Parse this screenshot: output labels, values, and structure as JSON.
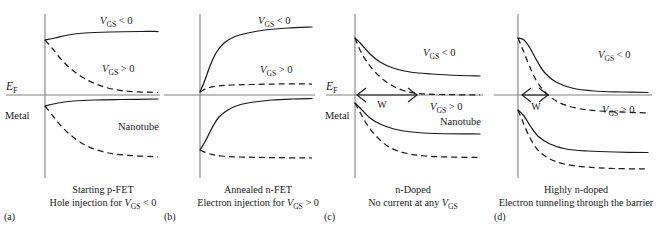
{
  "figure": {
    "width": 665,
    "height": 226,
    "background": "#ffffff",
    "ink_color": "#1a1a1a",
    "axis_color": "#808080"
  },
  "chart_data": {
    "type": "line",
    "xlabel": "",
    "ylabel": "Energy",
    "grid": false,
    "legend": "inline-annotations",
    "axis_note": "Vertical line = metal/nanotube interface; horizontal line = Fermi level E_F",
    "panels": [
      {
        "letter": "(a)",
        "caption_line1": "Starting p-FET",
        "caption_line2_prefix": "Hole injection for ",
        "caption_line2_var": "V",
        "caption_line2_sub": "GS",
        "caption_line2_suffix": " < 0",
        "ef_label_var": "E",
        "ef_label_sub": "F",
        "region_left": "Metal",
        "region_right": "Nanotube",
        "show_ef_label": true,
        "show_metal_label": true,
        "show_nanotube_label": true,
        "nanotube_label_x": 118,
        "nanotube_label_y": 130,
        "show_w_arrow": false,
        "w_label": "",
        "curves": [
          {
            "name": "conduction-band-vgs-negative",
            "style": "solid",
            "label": "VGS<0",
            "label_x": 100,
            "label_y": 24,
            "points": [
              [
                45,
                40
              ],
              [
                55,
                38
              ],
              [
                68,
                35
              ],
              [
                85,
                33
              ],
              [
                110,
                32
              ],
              [
                140,
                31.5
              ],
              [
                158,
                31.5
              ]
            ]
          },
          {
            "name": "conduction-band-vgs-positive",
            "style": "dashed",
            "label": "VGS>0",
            "label_x": 102,
            "label_y": 72,
            "points": [
              [
                45,
                40
              ],
              [
                52,
                48
              ],
              [
                60,
                58
              ],
              [
                70,
                68
              ],
              [
                82,
                77
              ],
              [
                96,
                84
              ],
              [
                112,
                89
              ],
              [
                130,
                91.5
              ],
              [
                158,
                92.5
              ]
            ]
          },
          {
            "name": "valence-band-vgs-negative",
            "style": "solid",
            "label": "",
            "label_x": 0,
            "label_y": 0,
            "points": [
              [
                45,
                106
              ],
              [
                58,
                103
              ],
              [
                74,
                101
              ],
              [
                95,
                100
              ],
              [
                120,
                99.5
              ],
              [
                158,
                99
              ]
            ]
          },
          {
            "name": "valence-band-vgs-positive",
            "style": "dashed",
            "label": "",
            "label_x": 0,
            "label_y": 0,
            "points": [
              [
                45,
                106
              ],
              [
                53,
                116
              ],
              [
                62,
                127
              ],
              [
                73,
                137
              ],
              [
                87,
                146
              ],
              [
                104,
                152
              ],
              [
                124,
                155
              ],
              [
                158,
                157
              ]
            ]
          }
        ]
      },
      {
        "letter": "(b)",
        "caption_line1": "Annealed n-FET",
        "caption_line2_prefix": "Electron injection for ",
        "caption_line2_var": "V",
        "caption_line2_sub": "GS",
        "caption_line2_suffix": " > 0",
        "ef_label_var": "",
        "ef_label_sub": "",
        "region_left": "",
        "region_right": "",
        "show_ef_label": false,
        "show_metal_label": false,
        "show_nanotube_label": false,
        "nanotube_label_x": 0,
        "nanotube_label_y": 0,
        "show_w_arrow": false,
        "w_label": "",
        "curves": [
          {
            "name": "conduction-band-vgs-negative",
            "style": "solid",
            "label": "VGS<0",
            "label_x": 98,
            "label_y": 24,
            "points": [
              [
                40,
                92
              ],
              [
                45,
                80
              ],
              [
                50,
                66
              ],
              [
                56,
                53
              ],
              [
                64,
                43
              ],
              [
                74,
                37
              ],
              [
                88,
                33
              ],
              [
                105,
                30
              ],
              [
                128,
                28
              ],
              [
                152,
                27
              ]
            ]
          },
          {
            "name": "conduction-band-vgs-positive",
            "style": "dashed",
            "label": "VGS>0",
            "label_x": 100,
            "label_y": 73,
            "points": [
              [
                40,
                92
              ],
              [
                48,
                88
              ],
              [
                58,
                86
              ],
              [
                72,
                85
              ],
              [
                92,
                84.5
              ],
              [
                118,
                84
              ],
              [
                152,
                84
              ]
            ]
          },
          {
            "name": "valence-band-vgs-negative",
            "style": "solid",
            "label": "",
            "label_x": 0,
            "label_y": 0,
            "points": [
              [
                40,
                150
              ],
              [
                46,
                140
              ],
              [
                52,
                128
              ],
              [
                59,
                117
              ],
              [
                68,
                110
              ],
              [
                79,
                105
              ],
              [
                94,
                102
              ],
              [
                112,
                100
              ],
              [
                132,
                99
              ],
              [
                152,
                98.5
              ]
            ]
          },
          {
            "name": "valence-band-vgs-positive",
            "style": "dashed",
            "label": "",
            "label_x": 0,
            "label_y": 0,
            "points": [
              [
                40,
                150
              ],
              [
                50,
                154
              ],
              [
                62,
                156
              ],
              [
                80,
                157
              ],
              [
                105,
                157.5
              ],
              [
                152,
                158
              ]
            ]
          }
        ]
      },
      {
        "letter": "(c)",
        "caption_line1": "n-Doped",
        "caption_line2_prefix": "No current at any ",
        "caption_line2_var": "V",
        "caption_line2_sub": "GS",
        "caption_line2_suffix": "",
        "ef_label_var": "E",
        "ef_label_sub": "F",
        "region_left": "Metal",
        "region_right": "Nanotube",
        "show_ef_label": true,
        "show_metal_label": true,
        "show_nanotube_label": true,
        "nanotube_label_x": 120,
        "nanotube_label_y": 125,
        "show_w_arrow": true,
        "w_label": "W",
        "w_arrow_x1": 37,
        "w_arrow_x2": 97,
        "w_label_x": 62,
        "w_label_y": 108,
        "curves": [
          {
            "name": "conduction-band-vgs-negative",
            "style": "solid",
            "label": "VGS<0",
            "label_x": 103,
            "label_y": 56,
            "points": [
              [
                35,
                38
              ],
              [
                42,
                45
              ],
              [
                50,
                54
              ],
              [
                60,
                62
              ],
              [
                73,
                68
              ],
              [
                90,
                72
              ],
              [
                112,
                74
              ],
              [
                140,
                75.5
              ],
              [
                160,
                76
              ]
            ]
          },
          {
            "name": "conduction-band-vgs-positive",
            "style": "dashed",
            "label": "VGS>0",
            "label_x": 110,
            "label_y": 110,
            "points": [
              [
                35,
                38
              ],
              [
                40,
                50
              ],
              [
                47,
                62
              ],
              [
                56,
                73
              ],
              [
                68,
                83
              ],
              [
                82,
                90
              ],
              [
                98,
                93.5
              ],
              [
                120,
                94.5
              ],
              [
                160,
                95
              ]
            ]
          },
          {
            "name": "valence-band-vgs-negative",
            "style": "solid",
            "label": "",
            "label_x": 0,
            "label_y": 0,
            "points": [
              [
                35,
                103
              ],
              [
                42,
                110
              ],
              [
                50,
                118
              ],
              [
                60,
                124
              ],
              [
                74,
                129
              ],
              [
                92,
                132
              ],
              [
                115,
                133.5
              ],
              [
                160,
                134
              ]
            ]
          },
          {
            "name": "valence-band-vgs-positive",
            "style": "dashed",
            "label": "",
            "label_x": 0,
            "label_y": 0,
            "points": [
              [
                35,
                103
              ],
              [
                41,
                114
              ],
              [
                48,
                126
              ],
              [
                57,
                137
              ],
              [
                69,
                147
              ],
              [
                85,
                153
              ],
              [
                105,
                156
              ],
              [
                130,
                157
              ],
              [
                160,
                157.5
              ]
            ]
          }
        ]
      },
      {
        "letter": "(d)",
        "caption_line1": "Highly n-doped",
        "caption_line2_prefix": "Electron tunneling through the barrier",
        "caption_line2_var": "",
        "caption_line2_sub": "",
        "caption_line2_suffix": "",
        "ef_label_var": "",
        "ef_label_sub": "",
        "region_left": "",
        "region_right": "",
        "show_ef_label": false,
        "show_metal_label": false,
        "show_nanotube_label": false,
        "nanotube_label_x": 0,
        "nanotube_label_y": 0,
        "show_w_arrow": true,
        "w_label": "W",
        "w_arrow_x1": 32,
        "w_arrow_x2": 58,
        "w_label_x": 46,
        "w_label_y": 110,
        "curves": [
          {
            "name": "conduction-band-vgs-negative",
            "style": "solid",
            "label": "VGS<0",
            "label_x": 108,
            "label_y": 58,
            "points": [
              [
                28,
                38
              ],
              [
                34,
                40
              ],
              [
                40,
                48
              ],
              [
                47,
                61
              ],
              [
                55,
                73
              ],
              [
                66,
                82
              ],
              [
                82,
                88
              ],
              [
                104,
                91
              ],
              [
                132,
                92
              ],
              [
                158,
                92.5
              ]
            ]
          },
          {
            "name": "conduction-band-vgs-positive",
            "style": "dashed",
            "label": "VGS>0",
            "label_x": 112,
            "label_y": 113,
            "points": [
              [
                28,
                38
              ],
              [
                33,
                50
              ],
              [
                39,
                65
              ],
              [
                46,
                80
              ],
              [
                55,
                92
              ],
              [
                68,
                102
              ],
              [
                86,
                108
              ],
              [
                110,
                111
              ],
              [
                158,
                113
              ]
            ]
          },
          {
            "name": "valence-band-vgs-negative",
            "style": "solid",
            "label": "",
            "label_x": 0,
            "label_y": 0,
            "points": [
              [
                28,
                110
              ],
              [
                34,
                116
              ],
              [
                41,
                127
              ],
              [
                49,
                137
              ],
              [
                60,
                144
              ],
              [
                76,
                149
              ],
              [
                98,
                151
              ],
              [
                125,
                152
              ],
              [
                158,
                152.5
              ]
            ]
          },
          {
            "name": "valence-band-vgs-positive",
            "style": "dashed",
            "label": "",
            "label_x": 0,
            "label_y": 0,
            "points": [
              [
                28,
                110
              ],
              [
                33,
                122
              ],
              [
                39,
                136
              ],
              [
                47,
                149
              ],
              [
                58,
                158
              ],
              [
                74,
                164
              ],
              [
                96,
                167
              ],
              [
                124,
                168.5
              ],
              [
                158,
                169
              ]
            ]
          }
        ]
      }
    ],
    "symbols": {
      "vgs_negative": "VGS < 0",
      "vgs_positive": "VGS > 0",
      "fermi_level": "EF",
      "barrier_width": "W",
      "gate_source_voltage_var": "V",
      "gate_source_voltage_sub": "GS",
      "less_than": "< 0",
      "greater_than": "> 0"
    }
  }
}
